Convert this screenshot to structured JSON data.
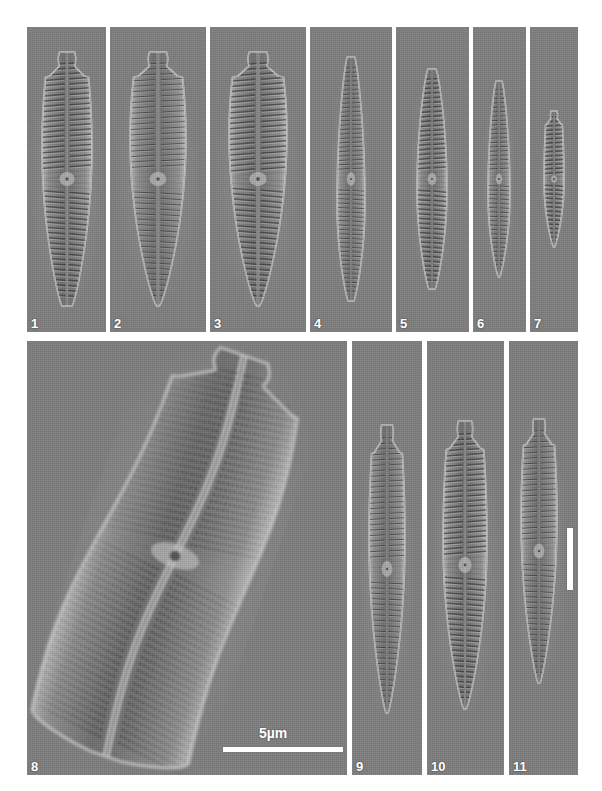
{
  "plate": {
    "background_color": "#ffffff",
    "panel_background_color": "#7e7e7e",
    "label_color": "#ffffff",
    "width": 602,
    "height": 791,
    "rows": 2
  },
  "scale_bars": {
    "horizontal": {
      "label": "5µm",
      "panel": "8",
      "color": "#ffffff",
      "length_px": 120
    },
    "vertical": {
      "label": "",
      "panel": "11",
      "color": "#ffffff",
      "length_px": 62
    }
  },
  "panels": [
    {
      "id": "1",
      "label": "1",
      "row": "top",
      "x": 27,
      "y": 27,
      "w": 79,
      "h": 305,
      "specimen": {
        "shape": "clavate-lanceolate",
        "orientation": "vertical",
        "cx": 40,
        "cy": 152,
        "half_width": 25,
        "half_height": 127,
        "apex_type": "capitate",
        "foot_type": "subrostrate",
        "stria_count": 46,
        "stria_style": "coarse-lineate",
        "waist_ratio": 0.38,
        "tilt_deg": 0
      }
    },
    {
      "id": "2",
      "label": "2",
      "row": "top",
      "x": 110,
      "y": 27,
      "w": 96,
      "h": 305,
      "specimen": {
        "shape": "clavate-cuneate",
        "orientation": "vertical",
        "cx": 48,
        "cy": 152,
        "half_width": 28,
        "half_height": 127,
        "apex_type": "capitate",
        "foot_type": "acute",
        "stria_count": 44,
        "stria_style": "fine-lineate",
        "waist_ratio": 0.34,
        "tilt_deg": 0
      }
    },
    {
      "id": "3",
      "label": "3",
      "row": "top",
      "x": 210,
      "y": 27,
      "w": 96,
      "h": 305,
      "specimen": {
        "shape": "clavate-cuneate",
        "orientation": "vertical",
        "cx": 48,
        "cy": 152,
        "half_width": 29,
        "half_height": 127,
        "apex_type": "capitate-undulate",
        "foot_type": "acute",
        "stria_count": 45,
        "stria_style": "coarse-lineate",
        "waist_ratio": 0.32,
        "tilt_deg": 0
      }
    },
    {
      "id": "4",
      "label": "4",
      "row": "top",
      "x": 310,
      "y": 27,
      "w": 82,
      "h": 305,
      "specimen": {
        "shape": "narrow-lanceolate",
        "orientation": "vertical",
        "cx": 41,
        "cy": 152,
        "half_width": 14,
        "half_height": 122,
        "apex_type": "rounded",
        "foot_type": "subrostrate",
        "stria_count": 52,
        "stria_style": "fine-lineate",
        "waist_ratio": 0.6,
        "tilt_deg": 0
      }
    },
    {
      "id": "5",
      "label": "5",
      "row": "top",
      "x": 396,
      "y": 27,
      "w": 73,
      "h": 305,
      "specimen": {
        "shape": "lanceolate",
        "orientation": "vertical",
        "cx": 36,
        "cy": 152,
        "half_width": 15,
        "half_height": 110,
        "apex_type": "rounded",
        "foot_type": "subrostrate",
        "stria_count": 44,
        "stria_style": "coarse-lineate",
        "waist_ratio": 0.55,
        "tilt_deg": 0
      }
    },
    {
      "id": "6",
      "label": "6",
      "row": "top",
      "x": 473,
      "y": 27,
      "w": 53,
      "h": 305,
      "specimen": {
        "shape": "narrow-lanceolate",
        "orientation": "vertical",
        "cx": 26,
        "cy": 152,
        "half_width": 11,
        "half_height": 98,
        "apex_type": "rounded",
        "foot_type": "acute",
        "stria_count": 42,
        "stria_style": "fine-lineate",
        "waist_ratio": 0.58,
        "tilt_deg": 0
      }
    },
    {
      "id": "7",
      "label": "7",
      "row": "top",
      "x": 530,
      "y": 27,
      "w": 48,
      "h": 305,
      "specimen": {
        "shape": "small-lanceolate",
        "orientation": "vertical",
        "cx": 24,
        "cy": 152,
        "half_width": 10,
        "half_height": 68,
        "apex_type": "capitate",
        "foot_type": "acute",
        "stria_count": 30,
        "stria_style": "coarse-lineate",
        "waist_ratio": 0.52,
        "tilt_deg": 0
      }
    },
    {
      "id": "8",
      "label": "8",
      "row": "bottom",
      "x": 27,
      "y": 341,
      "w": 320,
      "h": 434,
      "specimen": {
        "shape": "large-sigmoid-lanceolate",
        "orientation": "tilted",
        "cx": 148,
        "cy": 215,
        "half_width": 83,
        "half_height": 212,
        "apex_type": "broadly-capitate",
        "foot_type": "rostrate",
        "stria_count": 58,
        "stria_style": "punctate",
        "waist_ratio": 0.95,
        "tilt_deg": 19
      }
    },
    {
      "id": "9",
      "label": "9",
      "row": "bottom",
      "x": 352,
      "y": 341,
      "w": 70,
      "h": 434,
      "specimen": {
        "shape": "clavate-lanceolate",
        "orientation": "vertical",
        "cx": 35,
        "cy": 228,
        "half_width": 18,
        "half_height": 144,
        "apex_type": "capitate",
        "foot_type": "acute",
        "stria_count": 50,
        "stria_style": "fine-lineate",
        "waist_ratio": 0.4,
        "tilt_deg": 0
      }
    },
    {
      "id": "10",
      "label": "10",
      "row": "bottom",
      "x": 427,
      "y": 341,
      "w": 77,
      "h": 434,
      "specimen": {
        "shape": "clavate-lanceolate",
        "orientation": "vertical",
        "cx": 38,
        "cy": 224,
        "half_width": 22,
        "half_height": 144,
        "apex_type": "capitate",
        "foot_type": "acute",
        "stria_count": 52,
        "stria_style": "coarse-lineate",
        "waist_ratio": 0.42,
        "tilt_deg": 0
      }
    },
    {
      "id": "11",
      "label": "11",
      "row": "bottom",
      "x": 509,
      "y": 341,
      "w": 69,
      "h": 434,
      "specimen": {
        "shape": "clavate-lanceolate",
        "orientation": "vertical",
        "cx": 30,
        "cy": 210,
        "half_width": 18,
        "half_height": 132,
        "apex_type": "capitate",
        "foot_type": "acute",
        "stria_count": 46,
        "stria_style": "fine-lineate",
        "waist_ratio": 0.38,
        "tilt_deg": 0
      }
    }
  ]
}
